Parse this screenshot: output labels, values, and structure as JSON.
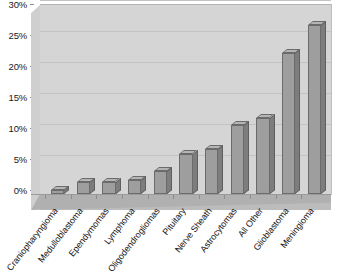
{
  "chart_data": {
    "type": "bar",
    "title": "",
    "subtitle": "",
    "xlabel": "",
    "ylabel": "",
    "ylim": [
      0,
      30
    ],
    "y_tick_labels": [
      "0%",
      "5%",
      "10%",
      "15%",
      "20%",
      "25%",
      "30%"
    ],
    "y_tick_values": [
      0,
      5,
      10,
      15,
      20,
      25,
      30
    ],
    "grid": true,
    "legend": null,
    "legend_position": "none",
    "units": "percent",
    "style": "3d-bar",
    "categories": [
      "Craniopharyngioma",
      "Medulloblastoma",
      "Ependymomas",
      "Lymphoma",
      "Oligodendrogliomas",
      "Pituitary",
      "Nerve Sheath",
      "Astrocytomas",
      "All Other",
      "Glioblastoma",
      "Meningioma"
    ],
    "values": [
      0.7,
      2.0,
      2.0,
      2.2,
      3.7,
      6.4,
      7.2,
      11.2,
      12.2,
      22.8,
      27.3
    ],
    "colors": {
      "bar_front": "#9e9e9e",
      "bar_side": "#7d7d7d",
      "bar_top": "#b5b5b5",
      "bar_outline": "#6b6b6b",
      "plot_background": "#d5d5d5",
      "floor": "#bcbcbc",
      "gridline": "#c2c2c2",
      "text": "#141414",
      "page_background": "#ffffff"
    }
  }
}
